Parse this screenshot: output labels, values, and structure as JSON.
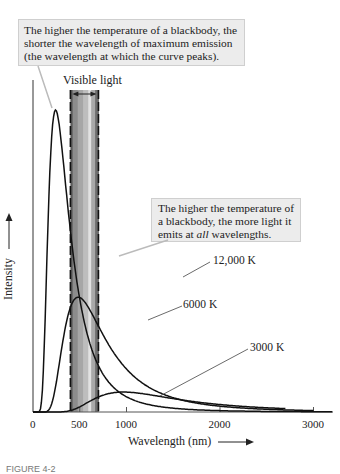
{
  "callouts": {
    "peak_shift": "The higher the temperature of a blackbody, the shorter the wavelength of maximum emission (the wavelength at which the curve peaks).",
    "more_light_part1": "The higher the temperature of a blackbody, the more light it emits at ",
    "more_light_emph": "all",
    "more_light_part2": " wavelengths."
  },
  "visible_band_label": "Visible light",
  "caption": "FIGURE 4-2",
  "chart_data": {
    "type": "line",
    "title": "",
    "xlabel": "Wavelength (nm)",
    "ylabel": "Intensity",
    "x_ticks": [
      0,
      500,
      1000,
      2000,
      3000
    ],
    "x_tick_labels": [
      "0",
      "500",
      "1000",
      "2000",
      "3000"
    ],
    "xlim": [
      0,
      3200
    ],
    "y_ticks": [],
    "grid": false,
    "visible_band_nm": [
      400,
      700
    ],
    "series": [
      {
        "name": "12,000 K",
        "temperature_K": 12000,
        "peak_nm": 240,
        "peak_relative_height": 1.0
      },
      {
        "name": "6000 K",
        "temperature_K": 6000,
        "peak_nm": 480,
        "peak_relative_height": 0.38
      },
      {
        "name": "3000 K",
        "temperature_K": 3000,
        "peak_nm": 970,
        "peak_relative_height": 0.066
      }
    ],
    "annotations": [
      "The higher the temperature of a blackbody, the shorter the wavelength of maximum emission (the wavelength at which the curve peaks).",
      "The higher the temperature of a blackbody, the more light it emits at all wavelengths.",
      "Visible light"
    ]
  }
}
